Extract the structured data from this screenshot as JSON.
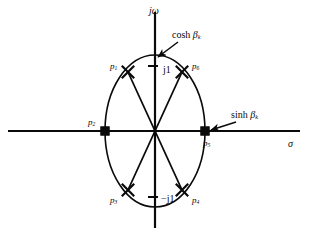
{
  "figure": {
    "background_color": "#ffffff",
    "ink_color": "#0a0a0a",
    "width": 312,
    "height": 237
  },
  "axes": {
    "vertical": {
      "name": "imaginary-axis",
      "label": "jω",
      "label_x": 149,
      "label_y": 6,
      "x": 155,
      "y_top": 12,
      "y_bottom": 228
    },
    "horizontal": {
      "name": "real-axis",
      "label": "σ",
      "label_x": 288,
      "label_y": 139,
      "y": 131,
      "x_left": 8,
      "x_right": 300
    }
  },
  "ticks": [
    {
      "name": "tick-j1-positive",
      "label_prefix": "—",
      "label": "j1",
      "value": 1,
      "x": 163,
      "y": 65,
      "dash_x1": 148,
      "dash_x2": 158,
      "dash_y": 66
    },
    {
      "name": "tick-j1-negative",
      "label_prefix": "—",
      "label": "−j1",
      "value": -1,
      "x": 161,
      "y": 194,
      "dash_x1": 148,
      "dash_x2": 158,
      "dash_y": 197
    }
  ],
  "ellipse": {
    "name": "pole-locus-ellipse",
    "cx": 155,
    "cy": 131,
    "rx": 50,
    "ry": 76,
    "stroke_width": 1.6
  },
  "chart_data": {
    "type": "scatter",
    "title": "",
    "xlabel": "σ",
    "ylabel": "jω",
    "xlim": [
      -1.25,
      1.25
    ],
    "ylim": [
      -1.25,
      1.25
    ],
    "grid": false,
    "legend": false,
    "locus": {
      "shape": "ellipse",
      "semi_major_axis_imag": "cosh βk",
      "semi_minor_axis_real": "sinh βk"
    },
    "points": [
      {
        "name": "p1",
        "label": "p",
        "sub": "1",
        "x": -0.5,
        "y": 0.866,
        "marker": "x"
      },
      {
        "name": "p2",
        "label": "p",
        "sub": "2",
        "x": -1.0,
        "y": 0.0,
        "marker": "square"
      },
      {
        "name": "p3",
        "label": "p",
        "sub": "3",
        "x": -0.5,
        "y": -0.866,
        "marker": "x"
      },
      {
        "name": "p4",
        "label": "p",
        "sub": "4",
        "x": 0.5,
        "y": -0.866,
        "marker": "x"
      },
      {
        "name": "p5",
        "label": "p",
        "sub": "5",
        "x": 1.0,
        "y": 0.0,
        "marker": "square"
      },
      {
        "name": "p6",
        "label": "p",
        "sub": "6",
        "x": 0.5,
        "y": 0.866,
        "marker": "x"
      }
    ]
  },
  "poles": [
    {
      "name": "pole-p1",
      "label": "p",
      "sub": "1",
      "marker": "x",
      "px": 128,
      "py": 72,
      "label_x": 110,
      "label_y": 62
    },
    {
      "name": "pole-p2",
      "label": "p",
      "sub": "2",
      "marker": "square",
      "px": 105,
      "py": 131,
      "label_x": 88,
      "label_y": 118
    },
    {
      "name": "pole-p3",
      "label": "p",
      "sub": "3",
      "marker": "x",
      "px": 128,
      "py": 190,
      "label_x": 110,
      "label_y": 196
    },
    {
      "name": "pole-p4",
      "label": "p",
      "sub": "4",
      "marker": "x",
      "px": 182,
      "py": 190,
      "label_x": 192,
      "label_y": 196
    },
    {
      "name": "pole-p5",
      "label": "p",
      "sub": "5",
      "marker": "square",
      "px": 205,
      "py": 131,
      "label_x": 203,
      "label_y": 139
    },
    {
      "name": "pole-p6",
      "label": "p",
      "sub": "6",
      "marker": "x",
      "px": 182,
      "py": 72,
      "label_x": 192,
      "label_y": 62
    }
  ],
  "radial_lines": [
    {
      "name": "radius-to-p1",
      "x2": 128,
      "y2": 72
    },
    {
      "name": "radius-to-p3",
      "x2": 128,
      "y2": 190
    },
    {
      "name": "radius-to-p4",
      "x2": 182,
      "y2": 190
    },
    {
      "name": "radius-to-p6",
      "x2": 182,
      "y2": 72
    }
  ],
  "annotations": [
    {
      "name": "annotation-cosh-beta",
      "text": "cosh ",
      "symbol": "β",
      "sub": "k",
      "label_x": 172,
      "label_y": 30,
      "arrow_x1": 178,
      "arrow_y1": 42,
      "arrow_x2": 158,
      "arrow_y2": 57
    },
    {
      "name": "annotation-sinh-beta",
      "text": "sinh ",
      "symbol": "β",
      "sub": "k",
      "label_x": 231,
      "label_y": 110,
      "arrow_x1": 236,
      "arrow_y1": 122,
      "arrow_x2": 211,
      "arrow_y2": 130
    }
  ]
}
